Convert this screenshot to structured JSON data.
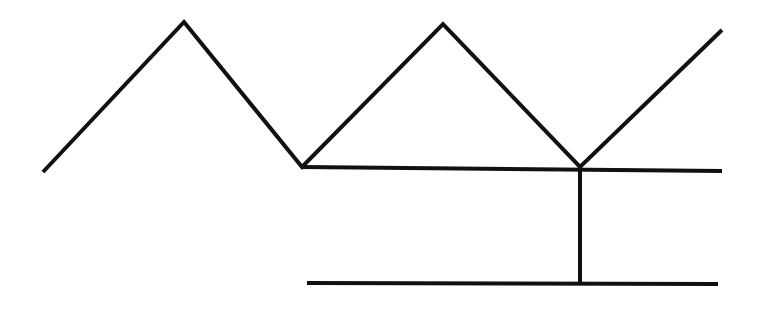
{
  "diagram": {
    "width": 762,
    "height": 309,
    "background": "#ffffff",
    "stroke_color": "#111111",
    "stroke_width": 4,
    "zigzag": {
      "points": [
        [
          43,
          172
        ],
        [
          184,
          22
        ],
        [
          302,
          167
        ],
        [
          443,
          24
        ],
        [
          580,
          167
        ],
        [
          722,
          30
        ]
      ]
    },
    "segments": [
      {
        "name": "upper-horizontal-line",
        "x1": 302,
        "y1": 167,
        "x2": 722,
        "y2": 171
      },
      {
        "name": "vertical-connector-line",
        "x1": 580,
        "y1": 167,
        "x2": 580,
        "y2": 283
      },
      {
        "name": "lower-horizontal-line",
        "x1": 307,
        "y1": 283,
        "x2": 718,
        "y2": 284
      }
    ]
  }
}
